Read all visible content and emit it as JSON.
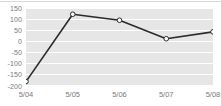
{
  "chart_data": {
    "type": "line",
    "title": "",
    "subtitle": "",
    "xlabel": "",
    "ylabel": "",
    "categories": [
      "5/04",
      "5/05",
      "5/06",
      "5/07",
      "5/08"
    ],
    "values": [
      -180,
      122,
      95,
      12,
      43
    ],
    "series": [
      {
        "name": "series-1",
        "values": [
          -180,
          122,
          95,
          12,
          43
        ]
      }
    ],
    "ylim": [
      -200,
      150
    ],
    "y_ticks": [
      150,
      100,
      50,
      0,
      -50,
      -100,
      -150,
      -200
    ],
    "y_tick_labels": [
      "150",
      "100",
      "50",
      "0",
      "-50",
      "-100",
      "-150",
      "-200"
    ],
    "x_tick_labels": [
      "5/04",
      "5/05",
      "5/06",
      "5/07",
      "5/08"
    ],
    "grid": true,
    "grid_style": "alternating-horizontal-bands",
    "legend": false,
    "legend_position": "none",
    "annotations": [],
    "colors": {
      "line": "#2b2b2b",
      "marker_fill": "#ffffff",
      "marker_stroke": "#2b2b2b",
      "band": "#e6e6e6",
      "plot_background": "#ffffff",
      "axis_text": "#7a7a7a",
      "page_background": "#ffffff",
      "top_rule": "#d8d8d8"
    },
    "marker": "open-circle",
    "line_width": 1.6
  }
}
